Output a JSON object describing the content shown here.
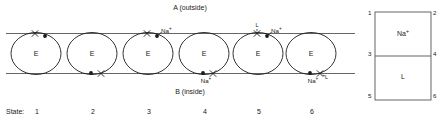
{
  "diagram": {
    "compartment_top_label": "A (outside)",
    "compartment_bottom_label": "B (inside)",
    "state_row_label": "State:",
    "enzyme_symbol": "E",
    "ion_label": "Na+",
    "ligand_label": "L",
    "states": [
      {
        "number": "1",
        "cx": 36,
        "top_x": true,
        "top_dot": true,
        "top_ion": false,
        "top_ligand": false,
        "bottom_x": false,
        "bottom_dot": false,
        "bottom_ion": false,
        "bottom_ligand": false
      },
      {
        "number": "2",
        "cx": 92,
        "top_x": false,
        "top_dot": false,
        "top_ion": false,
        "top_ligand": false,
        "bottom_x": true,
        "bottom_dot": true,
        "bottom_ion": false,
        "bottom_ligand": false
      },
      {
        "number": "3",
        "cx": 148,
        "top_x": true,
        "top_dot": true,
        "top_ion": true,
        "top_ligand": false,
        "bottom_x": false,
        "bottom_dot": false,
        "bottom_ion": false,
        "bottom_ligand": false
      },
      {
        "number": "4",
        "cx": 204,
        "top_x": false,
        "top_dot": false,
        "top_ion": false,
        "top_ligand": false,
        "bottom_x": true,
        "bottom_dot": true,
        "bottom_ion": true,
        "bottom_ligand": false
      },
      {
        "number": "5",
        "cx": 258,
        "top_x": true,
        "top_dot": true,
        "top_ion": true,
        "top_ligand": true,
        "bottom_x": false,
        "bottom_dot": false,
        "bottom_ion": false,
        "bottom_ligand": false
      },
      {
        "number": "6",
        "cx": 311,
        "top_x": false,
        "top_dot": false,
        "top_ion": false,
        "top_ligand": false,
        "bottom_x": true,
        "bottom_dot": true,
        "bottom_ion": true,
        "bottom_ligand": true
      }
    ]
  },
  "legend": {
    "corner_labels": [
      "1",
      "2",
      "3",
      "4",
      "5",
      "6"
    ],
    "top_cell_label": "Na+",
    "bottom_cell_label": "L"
  },
  "colors": {
    "stroke": "#1a1a1a",
    "line": "#555555",
    "text": "#1a1a1a",
    "background": "#ffffff"
  }
}
